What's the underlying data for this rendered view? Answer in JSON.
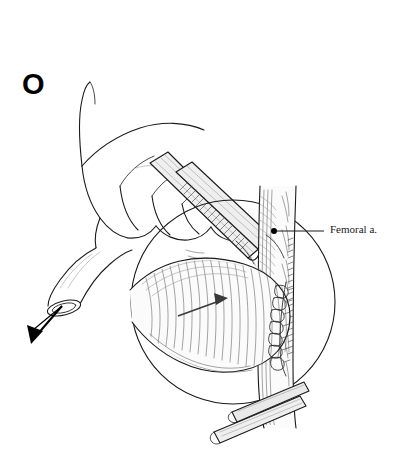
{
  "figure": {
    "panel_label": "O",
    "background_color": "#ffffff",
    "ink_color": "#1a1a1a",
    "width": 402,
    "height": 468
  },
  "annotations": {
    "femoral_artery": {
      "label": "Femoral a.",
      "leader_dot_x": 274,
      "leader_dot_y": 231,
      "leader_line_end_x": 324,
      "leader_line_end_y": 231
    }
  },
  "elements": {
    "hand": "surgeon-hand-grasping-graft",
    "graft": "tubular-vascular-graft",
    "traction_arrow": {
      "name": "downward-traction-arrow",
      "direction": "down",
      "color": "#000000"
    },
    "forceps": "surgical-forceps-serrated-jaws",
    "clamp": "vascular-clamp",
    "suture_line": "interrupted-anastomosis-sutures",
    "surgical_field": {
      "shape": "circle",
      "center_x": 233,
      "center_y": 302,
      "radius": 102
    }
  }
}
